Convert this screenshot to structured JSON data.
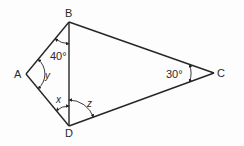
{
  "diagram": {
    "vertices": [
      {
        "id": "A",
        "label": "A"
      },
      {
        "id": "B",
        "label": "B"
      },
      {
        "id": "C",
        "label": "C"
      },
      {
        "id": "D",
        "label": "D"
      }
    ],
    "edges": [
      [
        "A",
        "B"
      ],
      [
        "B",
        "C"
      ],
      [
        "C",
        "D"
      ],
      [
        "D",
        "A"
      ],
      [
        "B",
        "D"
      ]
    ],
    "angles": [
      {
        "vertex": "B",
        "between": [
          "A",
          "D"
        ],
        "label": "40°"
      },
      {
        "vertex": "A",
        "between": [
          "B",
          "D"
        ],
        "label": "y"
      },
      {
        "vertex": "D",
        "between": [
          "A",
          "B"
        ],
        "label": "x"
      },
      {
        "vertex": "D",
        "between": [
          "B",
          "C"
        ],
        "label": "z"
      },
      {
        "vertex": "C",
        "between": [
          "B",
          "D"
        ],
        "label": "30°"
      }
    ]
  }
}
